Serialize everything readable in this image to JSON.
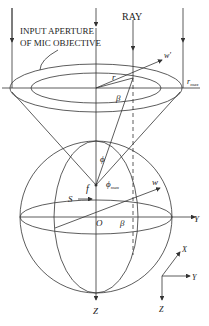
{
  "diagram": {
    "labels": {
      "aperture_line1": "INPUT APERTURE",
      "aperture_line2": "OF MIC OBJECTIVE",
      "ray": "RAY",
      "w_prime": "w'",
      "r_max": "r",
      "r_max_sub": "max",
      "r": "r",
      "beta_top": "β",
      "phi": "ϕ",
      "phi_max": "ϕ",
      "phi_max_sub": "max",
      "f": "f",
      "w": "w",
      "S": "S",
      "O": "O",
      "beta_bottom": "β",
      "Y_axis": "Y",
      "Z_axis": "Z",
      "axes_X": "X",
      "axes_Y": "Y",
      "axes_Z": "Z"
    },
    "colors": {
      "line": "#333333",
      "text": "#222222",
      "background": "#ffffff"
    }
  }
}
